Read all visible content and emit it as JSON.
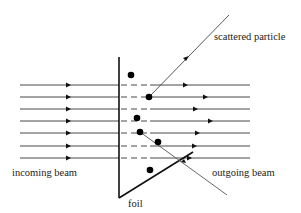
{
  "diagram": {
    "labels": {
      "scattered_particle": "scattered particle",
      "incoming_beam": "incoming beam",
      "outgoing_beam": "outgoing beam",
      "foil": "foil"
    },
    "beam_line_count": 7,
    "nucleus_count": 6,
    "colors": {
      "line": "#333333",
      "foil": "#111111",
      "nucleus": "#000000",
      "text": "#222222"
    }
  }
}
